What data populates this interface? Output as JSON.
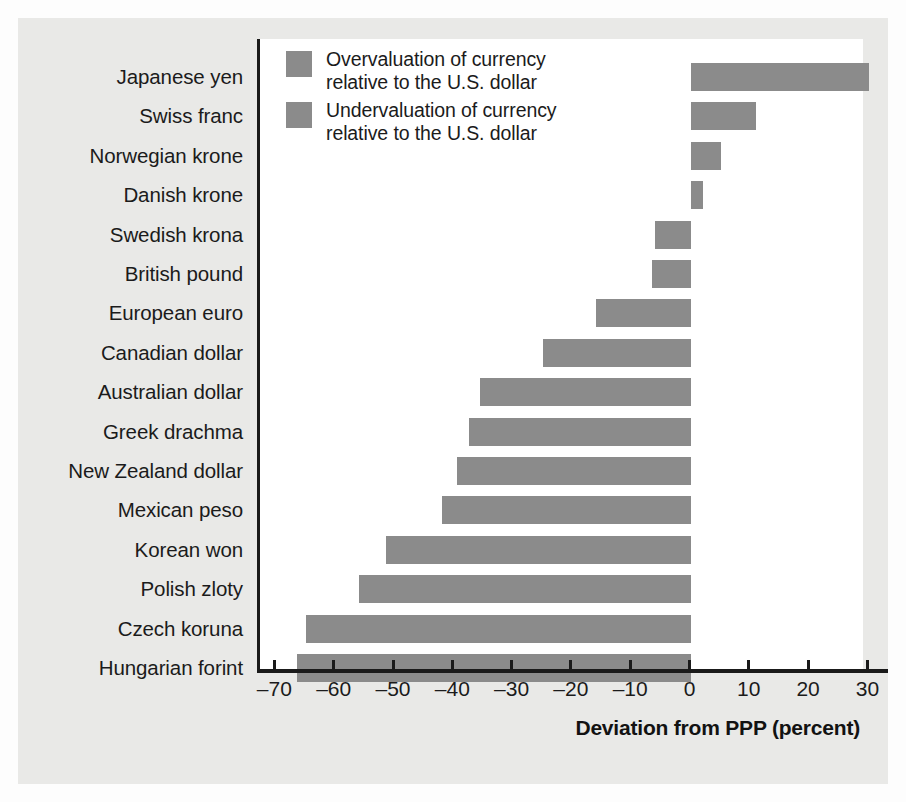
{
  "chart_data": {
    "type": "bar",
    "orientation": "horizontal",
    "title": "",
    "xlabel": "Deviation from PPP (percent)",
    "ylabel": "",
    "xlim": [
      -70,
      33
    ],
    "xticks": [
      -70,
      -60,
      -50,
      -40,
      -30,
      -20,
      -10,
      0,
      10,
      20,
      30
    ],
    "xticklabels": [
      "–70",
      "–60",
      "–50",
      "–40",
      "–30",
      "–20",
      "–10",
      "0",
      "10",
      "20",
      "30"
    ],
    "grid": false,
    "zero_line": 0,
    "categories": [
      "Japanese yen",
      "Swiss franc",
      "Norwegian krone",
      "Danish krone",
      "Swedish krona",
      "British pound",
      "European euro",
      "Canadian dollar",
      "Australian dollar",
      "Greek drachma",
      "New Zealand dollar",
      "Mexican peso",
      "Korean won",
      "Polish zloty",
      "Czech koruna",
      "Hungarian forint"
    ],
    "values": [
      30,
      11,
      5,
      2,
      -6,
      -6.5,
      -16,
      -25,
      -35.5,
      -37.5,
      -39.5,
      -42,
      -51.5,
      -56,
      -65,
      -66.5
    ],
    "bar_color": "#8b8b8b",
    "legend_position": "top-left",
    "legend": [
      {
        "label": "Overvaluation of currency\nrelative to the U.S. dollar",
        "color": "#8b8b8b"
      },
      {
        "label": "Undervaluation of currency\nrelative to the U.S. dollar",
        "color": "#8b8b8b"
      }
    ]
  },
  "colors": {
    "page_background": "#fdfdfd",
    "panel_background": "#e9e9e7",
    "plot_background": "#ffffff",
    "axis": "#1a1a1a",
    "text": "#1b1b1b",
    "bar": "#8b8b8b"
  }
}
